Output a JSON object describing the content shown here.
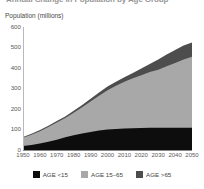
{
  "chart_title": "Annual Change in Population by Age Group",
  "y_axis_title": "Population (millions)",
  "y_ticks": [
    "600",
    "500",
    "400",
    "300",
    "200",
    "100",
    "0"
  ],
  "x_ticks": [
    "1950",
    "1960",
    "1970",
    "1980",
    "1990",
    "2000",
    "2010",
    "2020",
    "2030",
    "2040",
    "2050"
  ],
  "legend": {
    "items": [
      {
        "label": "AGE <15",
        "color": "#0d0d0d"
      },
      {
        "label": "AGE 15–65",
        "color": "#a8a8a8"
      },
      {
        "label": "AGE >65",
        "color": "#4d4d4d"
      }
    ]
  },
  "colors": {
    "under15": "#0d0d0d",
    "working": "#a8a8a8",
    "over65": "#4d4d4d",
    "axis": "#8a8a8a",
    "text": "#4a4a4a",
    "background": "#ffffff"
  },
  "chart_data": {
    "type": "area",
    "title": "Annual Change in Population by Age Group",
    "xlabel": "",
    "ylabel": "Population (millions)",
    "xlim": [
      1950,
      2050
    ],
    "ylim": [
      0,
      600
    ],
    "grid": false,
    "legend_position": "bottom",
    "stacked": true,
    "x": [
      1950,
      1955,
      1960,
      1965,
      1970,
      1975,
      1980,
      1985,
      1990,
      1995,
      2000,
      2005,
      2010,
      2015,
      2020,
      2025,
      2030,
      2035,
      2040,
      2045,
      2050
    ],
    "series": [
      {
        "name": "AGE <15",
        "values": [
          20,
          25,
          32,
          40,
          50,
          62,
          72,
          80,
          88,
          95,
          100,
          103,
          105,
          106,
          107,
          108,
          108,
          108,
          108,
          108,
          108
        ]
      },
      {
        "name": "AGE 15-65",
        "values": [
          40,
          50,
          60,
          72,
          84,
          94,
          110,
          128,
          148,
          170,
          192,
          210,
          228,
          244,
          258,
          272,
          284,
          300,
          316,
          334,
          347
        ]
      },
      {
        "name": "AGE >65",
        "values": [
          3,
          4,
          5,
          6,
          7,
          8,
          10,
          12,
          14,
          16,
          18,
          20,
          22,
          26,
          32,
          40,
          50,
          58,
          64,
          68,
          70
        ]
      }
    ],
    "totals": [
      63,
      79,
      97,
      118,
      141,
      164,
      192,
      220,
      250,
      281,
      310,
      333,
      355,
      376,
      397,
      420,
      442,
      466,
      488,
      510,
      525
    ]
  }
}
